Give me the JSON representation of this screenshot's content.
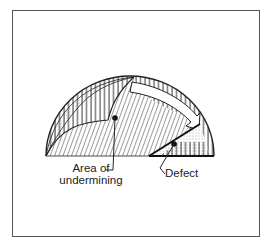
{
  "figure": {
    "labels": {
      "area_line1": "Area of",
      "area_line2": "undermining",
      "defect": "Defect"
    },
    "colors": {
      "stroke": "#222222",
      "frame": "#555555",
      "background": "#ffffff"
    }
  }
}
